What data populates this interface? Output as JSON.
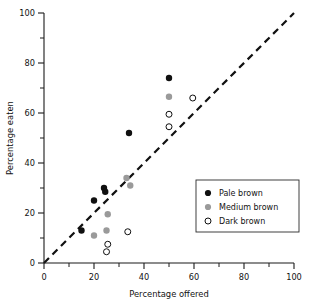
{
  "chart_data": {
    "type": "scatter",
    "title": "",
    "xlabel": "Percentage offered",
    "ylabel": "Percentage eaten",
    "xlim": [
      0,
      100
    ],
    "ylim": [
      0,
      100
    ],
    "xticks": [
      0,
      20,
      40,
      60,
      80,
      100
    ],
    "yticks": [
      0,
      20,
      40,
      60,
      80,
      100
    ],
    "xtick_labels": [
      "0",
      "20",
      "40",
      "60",
      "80",
      "100"
    ],
    "ytick_labels": [
      "0",
      "20",
      "40",
      "60",
      "80",
      "100"
    ],
    "minor_tick_interval": 10,
    "grid": false,
    "legend_position": "lower-right",
    "reference_line": {
      "description": "dashed identity line y = x",
      "from": [
        0,
        0
      ],
      "to": [
        100,
        100
      ],
      "style": "dashed",
      "color": "#111111"
    },
    "series": [
      {
        "name": "Pale brown",
        "marker": "filled-circle",
        "color": "#101010",
        "points": [
          [
            15,
            13
          ],
          [
            20,
            25
          ],
          [
            24,
            30
          ],
          [
            24.5,
            28.5
          ],
          [
            34,
            52
          ],
          [
            50,
            74
          ]
        ]
      },
      {
        "name": "Medium brown",
        "marker": "filled-circle-gray",
        "color": "#9a9a9a",
        "points": [
          [
            20,
            11
          ],
          [
            25,
            13
          ],
          [
            25.5,
            19.5
          ],
          [
            33,
            34
          ],
          [
            34.5,
            31
          ],
          [
            50,
            66.5
          ]
        ]
      },
      {
        "name": "Dark brown",
        "marker": "open-circle",
        "color": "#ffffff",
        "points": [
          [
            25,
            4.5
          ],
          [
            25.5,
            7.5
          ],
          [
            33.5,
            12.5
          ],
          [
            50,
            54.5
          ],
          [
            50,
            59.5
          ],
          [
            59.5,
            66
          ]
        ]
      }
    ]
  },
  "legend": {
    "entries": [
      {
        "label": "Pale brown",
        "marker": "filled-circle"
      },
      {
        "label": "Medium brown",
        "marker": "filled-circle-gray"
      },
      {
        "label": "Dark brown",
        "marker": "open-circle"
      }
    ]
  }
}
